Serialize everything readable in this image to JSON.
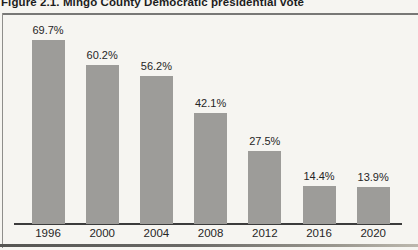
{
  "figure": {
    "title": "Figure 2.1. Mingo County Democratic presidential vote"
  },
  "chart_data": {
    "type": "bar",
    "title": "Figure 2.1. Mingo County Democratic presidential vote",
    "categories": [
      "1996",
      "2000",
      "2004",
      "2008",
      "2012",
      "2016",
      "2020"
    ],
    "values": [
      69.7,
      60.2,
      56.2,
      42.1,
      27.5,
      14.4,
      13.9
    ],
    "value_label_suffix": "%",
    "xlabel": "",
    "ylabel": "",
    "ylim": [
      0,
      75
    ],
    "grid": false,
    "legend": "none",
    "data_labels": "above-bars",
    "colors": {
      "bar": "#9d9c99",
      "axis_line": "#3c3c3c",
      "label_text": "#262626",
      "background": "#f6f5f1",
      "frame_rule": "#787876"
    }
  }
}
